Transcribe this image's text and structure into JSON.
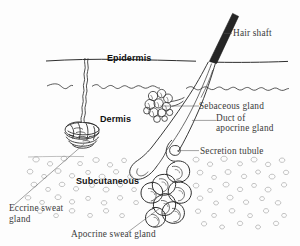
{
  "figure": {
    "background_color": "#fdfdfd",
    "ink_color": "#2e2e2e",
    "leader_color": "#555555",
    "fat_cell_color": "#9a9a9a",
    "hair_shaft_color": "#262626"
  },
  "layers": [
    {
      "id": "epidermis",
      "label": "Epidermis"
    },
    {
      "id": "dermis",
      "label": "Dermis"
    },
    {
      "id": "subcutaneous",
      "label": "Subcutaneous"
    }
  ],
  "callouts": [
    {
      "id": "hair-shaft",
      "label": "Hair shaft"
    },
    {
      "id": "sebaceous-gland",
      "label": "Sebaceous gland"
    },
    {
      "id": "duct-of-apocrine-gland",
      "label_line1": "Duct of",
      "label_line2": "apocrine gland"
    },
    {
      "id": "secretion-tubule",
      "label": "Secretion tubule"
    },
    {
      "id": "eccrine-sweat-gland",
      "label_line1": "Eccrine sweat",
      "label_line2": "gland"
    },
    {
      "id": "apocrine-sweat-gland",
      "label": "Apocrine sweat gland"
    }
  ]
}
